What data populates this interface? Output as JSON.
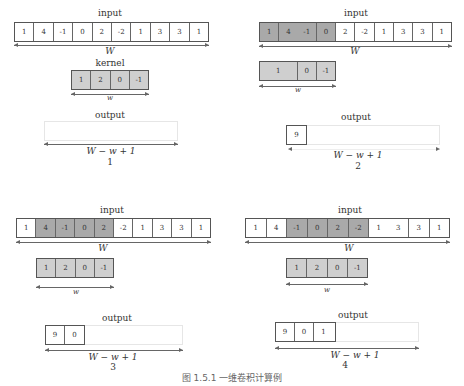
{
  "figure": {
    "caption": "图 1.5.1    一维卷积计算例",
    "labels": {
      "input": "input",
      "kernel": "kernel",
      "output": "output",
      "input_width": "W",
      "kernel_width": "w",
      "output_width": "W − w + 1"
    },
    "input_values": [
      "1",
      "4",
      "-1",
      "0",
      "2",
      "-2",
      "1",
      "3",
      "3",
      "1"
    ],
    "kernel_values": [
      "1",
      "2",
      "0",
      "-1"
    ],
    "colors": {
      "highlight": "#a9a9a9",
      "kernel_fill": "#cfcfcf",
      "border": "#555555"
    },
    "panels": [
      {
        "number": "1",
        "window_start": null,
        "output_values": []
      },
      {
        "number": "2",
        "window_start": 0,
        "output_values": [
          "9"
        ]
      },
      {
        "number": "3",
        "window_start": 1,
        "output_values": [
          "9",
          "0"
        ]
      },
      {
        "number": "4",
        "window_start": 2,
        "output_values": [
          "9",
          "0",
          "1"
        ]
      }
    ]
  }
}
